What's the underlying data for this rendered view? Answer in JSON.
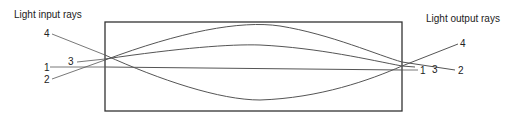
{
  "labels": {
    "input": "Light input rays",
    "output": "Light output rays"
  },
  "rays": [
    {
      "id": "1",
      "left_label": "1",
      "right_label": "1"
    },
    {
      "id": "2",
      "left_label": "2",
      "right_label": "2"
    },
    {
      "id": "3",
      "left_label": "3",
      "right_label": "3"
    },
    {
      "id": "4",
      "left_label": "4",
      "right_label": "4"
    }
  ],
  "colors": {
    "stroke": "#555555",
    "text": "#222222"
  }
}
